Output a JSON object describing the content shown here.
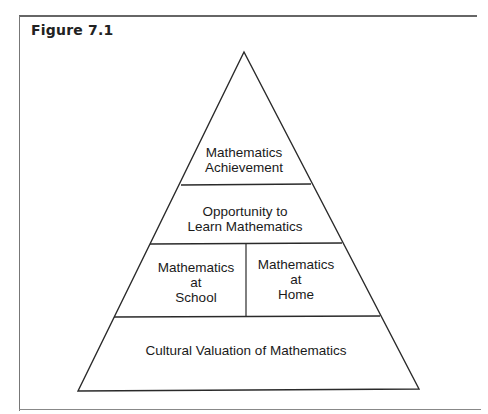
{
  "figure": {
    "title": "Figure 7.1"
  },
  "pyramid": {
    "levels": [
      {
        "id": "top",
        "label_lines": [
          "Mathematics",
          "Achievement"
        ]
      },
      {
        "id": "second",
        "label_lines": [
          "Opportunity to",
          "Learn Mathematics"
        ]
      },
      {
        "id": "third-left",
        "label_lines": [
          "Mathematics",
          "at",
          "School"
        ]
      },
      {
        "id": "third-right",
        "label_lines": [
          "Mathematics",
          "at",
          "Home"
        ]
      },
      {
        "id": "base",
        "label_lines": [
          "Cultural Valuation of Mathematics"
        ]
      }
    ]
  },
  "colors": {
    "line": "#2a2a2a",
    "frame": "#777777",
    "text": "#1a1a1a",
    "background": "#ffffff"
  }
}
